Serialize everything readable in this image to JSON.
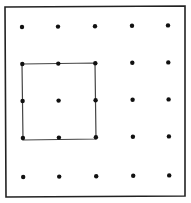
{
  "diagram": {
    "type": "geoboard",
    "grid": {
      "rows": 5,
      "cols": 5
    },
    "colors": {
      "frame": "#222222",
      "dot": "#111111",
      "square": "#444444",
      "background": "#ffffff"
    },
    "frame": {
      "x1": 5,
      "y1": 7,
      "x2": 185,
      "y2": 196
    },
    "dot_x": [
      22,
      58,
      95,
      132,
      168
    ],
    "dot_y": [
      27,
      64,
      101,
      138,
      177
    ],
    "square": {
      "from": {
        "col": 0,
        "row": 1
      },
      "to": {
        "col": 2,
        "row": 3
      },
      "points": [
        [
          22,
          64
        ],
        [
          95,
          63
        ],
        [
          96,
          139
        ],
        [
          23,
          140
        ]
      ]
    }
  }
}
